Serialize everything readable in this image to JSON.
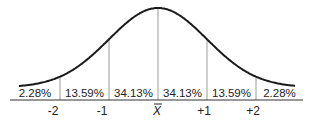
{
  "diagram": {
    "regions": [
      {
        "id": "below-minus-2",
        "label": "2.28%",
        "from_sd": -3,
        "to_sd": -2
      },
      {
        "id": "minus-2-to-minus-1",
        "label": "13.59%",
        "from_sd": -2,
        "to_sd": -1
      },
      {
        "id": "minus-1-to-mean",
        "label": "34.13%",
        "from_sd": -1,
        "to_sd": 0
      },
      {
        "id": "mean-to-plus-1",
        "label": "34.13%",
        "from_sd": 0,
        "to_sd": 1
      },
      {
        "id": "plus-1-to-plus-2",
        "label": "13.59%",
        "from_sd": 1,
        "to_sd": 2
      },
      {
        "id": "above-plus-2",
        "label": "2.28%",
        "from_sd": 2,
        "to_sd": 3
      }
    ],
    "ticks": [
      {
        "sd": -2,
        "label": "-2"
      },
      {
        "sd": -1,
        "label": "-1"
      },
      {
        "sd": 0,
        "label": "X",
        "is_mean": true
      },
      {
        "sd": 1,
        "label": "+1"
      },
      {
        "sd": 2,
        "label": "+2"
      }
    ],
    "colors": {
      "curve": "#1a1a1a",
      "dividers": "#9a9a9a",
      "text": "#222222"
    }
  }
}
